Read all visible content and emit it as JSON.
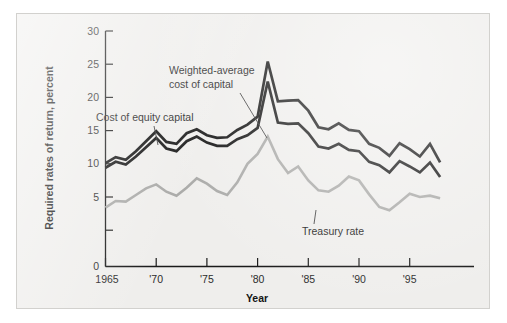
{
  "figure": {
    "background_color": "#efeeec",
    "border_color": "#d2d1ce"
  },
  "axes": {
    "y_title": "Required rates of return, percent",
    "x_title": "Year",
    "y_ticks": [
      "0",
      "5",
      "10",
      "15",
      "20",
      "25",
      "30"
    ],
    "x_ticks": [
      "1965",
      "'70",
      "'75",
      "'80",
      "'85",
      "'90",
      "'95"
    ]
  },
  "annotations": [
    {
      "name": "cost-of-equity-capital",
      "text_line1": "Cost of equity capital",
      "text_line2": ""
    },
    {
      "name": "weighted-average-cost-of-capital",
      "text_line1": "Weighted-average",
      "text_line2": "cost of capital"
    },
    {
      "name": "treasury-rate",
      "text_line1": "Treasury rate",
      "text_line2": ""
    }
  ],
  "colors": {
    "equity_line": "#161616",
    "wacc_line": "#161616",
    "treasury_line": "#aaaaa8",
    "axis": "#1a1a1a"
  },
  "chart_data": {
    "type": "line",
    "title": "",
    "xlabel": "Year",
    "ylabel": "Required rates of return, percent",
    "xlim": [
      1965,
      1998
    ],
    "ylim": [
      0,
      30
    ],
    "y_ticks": [
      0,
      5,
      10,
      15,
      20,
      25,
      30
    ],
    "x_ticks": [
      1965,
      1970,
      1975,
      1980,
      1985,
      1990,
      1995
    ],
    "x_tick_labels": [
      "1965",
      "'70",
      "'75",
      "'80",
      "'85",
      "'90",
      "'95"
    ],
    "grid": false,
    "legend": "inline-annotations",
    "x": [
      1965,
      1966,
      1967,
      1968,
      1969,
      1970,
      1971,
      1972,
      1973,
      1974,
      1975,
      1976,
      1977,
      1978,
      1979,
      1980,
      1981,
      1982,
      1983,
      1984,
      1985,
      1986,
      1987,
      1988,
      1989,
      1990,
      1991,
      1992,
      1993,
      1994,
      1995,
      1996,
      1997,
      1998
    ],
    "series": [
      {
        "name": "Cost of equity capital",
        "color": "#161616",
        "values": [
          10.1,
          11.0,
          10.6,
          11.9,
          13.4,
          14.9,
          13.3,
          13.0,
          14.6,
          15.2,
          14.3,
          13.9,
          14.0,
          15.1,
          15.9,
          17.1,
          25.4,
          19.4,
          19.5,
          19.6,
          18.0,
          15.5,
          15.2,
          16.1,
          15.1,
          14.9,
          13.0,
          12.4,
          11.2,
          13.1,
          12.2,
          11.1,
          13.0,
          10.2
        ],
        "annotation": "Cost of equity capital"
      },
      {
        "name": "Weighted-average cost of capital",
        "color": "#161616",
        "values": [
          9.4,
          10.3,
          9.9,
          11.1,
          12.5,
          13.9,
          12.3,
          11.9,
          13.4,
          14.1,
          13.2,
          12.7,
          12.7,
          13.7,
          14.3,
          15.4,
          22.4,
          16.2,
          16.0,
          16.1,
          14.6,
          12.6,
          12.3,
          13.0,
          12.1,
          11.9,
          10.3,
          9.8,
          8.7,
          10.4,
          9.6,
          8.7,
          10.2,
          8.0
        ],
        "annotation": "Weighted-average cost of capital"
      },
      {
        "name": "Treasury rate",
        "color": "#aaaaa8",
        "values": [
          3.4,
          4.4,
          4.3,
          5.3,
          6.3,
          6.9,
          5.8,
          5.2,
          6.4,
          7.8,
          7.0,
          5.9,
          5.3,
          7.2,
          10.0,
          11.5,
          14.1,
          10.7,
          8.6,
          9.6,
          7.5,
          6.0,
          5.8,
          6.7,
          8.1,
          7.5,
          5.4,
          3.5,
          3.0,
          4.2,
          5.5,
          5.0,
          5.2,
          4.8
        ],
        "annotation": "Treasury rate"
      }
    ]
  }
}
